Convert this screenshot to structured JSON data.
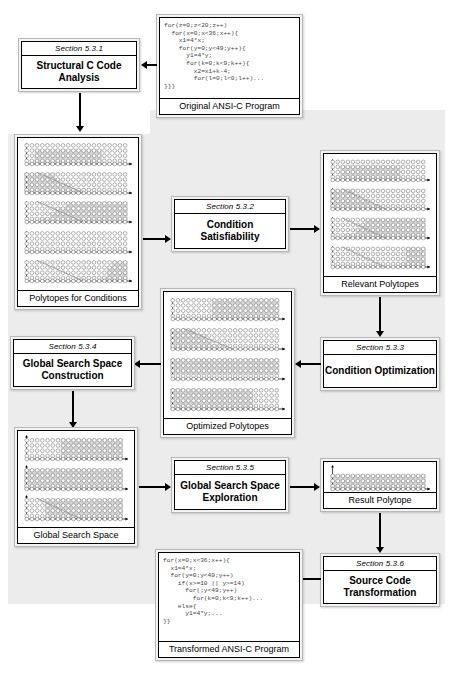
{
  "diagram": {
    "accent_color": "#ececec",
    "line_color": "#000000"
  },
  "nodes": {
    "original_program": {
      "caption": "Original ANSI-C Program",
      "code": "for(z=0;z<20;z++)\n  for(x=0;x<36;x++){\n    x1=4*x;\n    for(y=0;y<49;y++){\n      y1=4*y;\n      for(k=0;k<9;k++){\n        x2=x1+k-4;\n        for(l=0;l<0;l++)...\n}}}"
    },
    "section_531": {
      "section": "Section 5.3.1",
      "title": "Structural C Code Analysis"
    },
    "polytopes_conditions": {
      "caption": "Polytopes for Conditions",
      "plot_count": 5
    },
    "section_532": {
      "section": "Section 5.3.2",
      "title": "Condition Satisfiability"
    },
    "relevant_polytopes": {
      "caption": "Relevant Polytopes",
      "plot_count": 4
    },
    "section_533": {
      "section": "Section 5.3.3",
      "title": "Condition Optimization"
    },
    "optimized_polytopes": {
      "caption": "Optimized Polytopes",
      "plot_count": 4
    },
    "section_534": {
      "section": "Section 5.3.4",
      "title": "Global Search Space Construction"
    },
    "global_search_space": {
      "caption": "Global Search Space",
      "plot_count": 3
    },
    "section_535": {
      "section": "Section 5.3.5",
      "title": "Global Search Space Exploration"
    },
    "result_polytope": {
      "caption": "Result Polytope",
      "plot_count": 1
    },
    "section_536": {
      "section": "Section 5.3.6",
      "title": "Source Code Transformation"
    },
    "transformed_program": {
      "caption": "Transformed ANSI-C Program",
      "code": "for(x=0;x<36;x++){\n  x1=4*x;\n  for(y=0;y<49;y++)\n    if(x>=10 || y>=14)\n      for(;y<49;y++)\n        for(k=0;k<9;k++)...\n    else{\n      y1=4*y;...\n}}"
    }
  },
  "flow": [
    {
      "from": "original_program",
      "to": "section_531",
      "direction": "left"
    },
    {
      "from": "section_531",
      "to": "polytopes_conditions",
      "direction": "down"
    },
    {
      "from": "polytopes_conditions",
      "to": "section_532",
      "direction": "right"
    },
    {
      "from": "section_532",
      "to": "relevant_polytopes",
      "direction": "right"
    },
    {
      "from": "relevant_polytopes",
      "to": "section_533",
      "direction": "down"
    },
    {
      "from": "section_533",
      "to": "optimized_polytopes",
      "direction": "left"
    },
    {
      "from": "optimized_polytopes",
      "to": "section_534",
      "direction": "left"
    },
    {
      "from": "section_534",
      "to": "global_search_space",
      "direction": "down"
    },
    {
      "from": "global_search_space",
      "to": "section_535",
      "direction": "right"
    },
    {
      "from": "section_535",
      "to": "result_polytope",
      "direction": "right"
    },
    {
      "from": "result_polytope",
      "to": "section_536",
      "direction": "down"
    },
    {
      "from": "section_536",
      "to": "transformed_program",
      "direction": "left"
    }
  ]
}
